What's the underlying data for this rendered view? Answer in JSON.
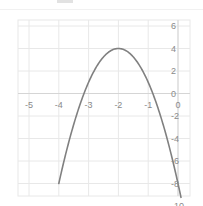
{
  "chart_data": {
    "type": "line",
    "title": "",
    "subtitle": "",
    "xlabel": "",
    "ylabel": "",
    "xlim": [
      -5.5,
      0.5
    ],
    "ylim": [
      -10.5,
      6.5
    ],
    "xticks": [
      -5,
      -4,
      -3,
      -2,
      -1,
      0
    ],
    "yticks": [
      6,
      4,
      2,
      0,
      -2,
      -4,
      -6,
      -8,
      -10
    ],
    "xtick_labels": [
      "-5",
      "-4",
      "-3",
      "-2",
      "-1",
      "0"
    ],
    "ytick_labels": [
      "6",
      "4",
      "2",
      "0",
      "-2",
      "-4",
      "-6",
      "-8",
      "-10"
    ],
    "grid": true,
    "legend": null,
    "axis_position": {
      "x_axis_at_y": 0,
      "y_axis_at_x": 0
    },
    "series": [
      {
        "name": "parabola",
        "equation": "y = -3(x + 2)^2 + 4",
        "color": "#808080",
        "linewidth": 1.6,
        "vertex": [
          -2,
          4
        ],
        "x": [
          -4.0,
          -3.8,
          -3.6,
          -3.4,
          -3.2,
          -3.0,
          -2.8,
          -2.6,
          -2.4,
          -2.2,
          -2.0,
          -1.8,
          -1.6,
          -1.4,
          -1.2,
          -1.0,
          -0.8,
          -0.6,
          -0.4,
          -0.2,
          0.0,
          0.1
        ],
        "values": [
          -8.0,
          -6.92,
          -5.92,
          -5.0,
          -4.16,
          -1.0,
          2.08,
          2.92,
          3.52,
          3.88,
          4.0,
          3.88,
          3.52,
          2.92,
          2.08,
          1.0,
          -0.32,
          -1.88,
          -3.68,
          -5.72,
          -8.0,
          -9.23
        ]
      }
    ]
  },
  "style": {
    "background": "#ffffff",
    "grid_color": "#e8e8e8",
    "axis_color": "#d5d5d5",
    "tick_text_color": "#8a8a8a",
    "curve_color": "#808080"
  },
  "axis_labels": {
    "x": [
      {
        "text": "-5",
        "value": -5
      },
      {
        "text": "-4",
        "value": -4
      },
      {
        "text": "-3",
        "value": -3
      },
      {
        "text": "-2",
        "value": -2
      },
      {
        "text": "-1",
        "value": -1
      },
      {
        "text": "0",
        "value": 0
      }
    ],
    "y": [
      {
        "text": "6",
        "value": 6
      },
      {
        "text": "4",
        "value": 4
      },
      {
        "text": "2",
        "value": 2
      },
      {
        "text": "0",
        "value": 0
      },
      {
        "text": "-2",
        "value": -2
      },
      {
        "text": "-4",
        "value": -4
      },
      {
        "text": "-6",
        "value": -6
      },
      {
        "text": "-8",
        "value": -8
      },
      {
        "text": "-10",
        "value": -10
      }
    ]
  }
}
